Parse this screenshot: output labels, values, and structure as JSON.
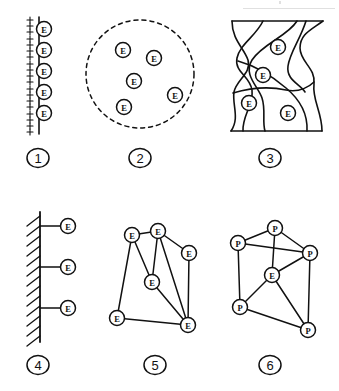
{
  "figure": {
    "width": 339,
    "height": 391,
    "background": "#ffffff",
    "ink_color": "#111111",
    "node_fill": "#ffffff"
  },
  "panels": [
    {
      "id": "panel-1",
      "number": "1",
      "kind": "charged-surface-with-electrons",
      "number_pos": {
        "x": 38,
        "y": 158
      },
      "surface": {
        "type": "vertical-line",
        "x": 39,
        "y_top": 17,
        "y_bottom": 134
      },
      "charges": {
        "symbol": "+",
        "count": 19,
        "x": 30,
        "y_start": 20,
        "y_step": 6.2
      },
      "nodes": [
        {
          "label": "E",
          "x": 44,
          "y": 29
        },
        {
          "label": "E",
          "x": 44,
          "y": 50
        },
        {
          "label": "E",
          "x": 44,
          "y": 71
        },
        {
          "label": "E",
          "x": 44,
          "y": 92
        },
        {
          "label": "E",
          "x": 44,
          "y": 113
        }
      ],
      "node_radius": 7.5
    },
    {
      "id": "panel-2",
      "number": "2",
      "kind": "dashed-boundary-with-free-electrons",
      "number_pos": {
        "x": 140,
        "y": 158
      },
      "boundary": {
        "type": "dashed-circle",
        "cx": 140,
        "cy": 74,
        "r": 54,
        "dash": "4 4"
      },
      "nodes": [
        {
          "label": "E",
          "x": 123,
          "y": 50
        },
        {
          "label": "E",
          "x": 154,
          "y": 58
        },
        {
          "label": "E",
          "x": 134,
          "y": 81
        },
        {
          "label": "E",
          "x": 175,
          "y": 95
        },
        {
          "label": "E",
          "x": 124,
          "y": 107
        }
      ],
      "node_radius": 7.5
    },
    {
      "id": "panel-3",
      "number": "3",
      "kind": "grain-cells-with-electrons",
      "number_pos": {
        "x": 270,
        "y": 158
      },
      "nodes": [
        {
          "label": "E",
          "x": 278,
          "y": 47
        },
        {
          "label": "E",
          "x": 263,
          "y": 75
        },
        {
          "label": "E",
          "x": 249,
          "y": 103
        },
        {
          "label": "E",
          "x": 288,
          "y": 113
        }
      ],
      "node_radius": 7.5
    },
    {
      "id": "panel-4",
      "number": "4",
      "kind": "hatched-wall-with-bound-electrons",
      "number_pos": {
        "x": 38,
        "y": 365
      },
      "wall": {
        "type": "hatched-vertical-line",
        "x": 40,
        "y_top": 212,
        "y_bottom": 342,
        "hatch_count": 13
      },
      "nodes": [
        {
          "label": "E",
          "x": 68,
          "y": 226
        },
        {
          "label": "E",
          "x": 68,
          "y": 267
        },
        {
          "label": "E",
          "x": 68,
          "y": 308
        }
      ],
      "node_radius": 7.5
    },
    {
      "id": "panel-5",
      "number": "5",
      "kind": "electron-network",
      "number_pos": {
        "x": 155,
        "y": 365
      },
      "nodes": [
        {
          "id": "a",
          "label": "E",
          "x": 132,
          "y": 235
        },
        {
          "id": "b",
          "label": "E",
          "x": 158,
          "y": 231
        },
        {
          "id": "c",
          "label": "E",
          "x": 189,
          "y": 253
        },
        {
          "id": "d",
          "label": "E",
          "x": 152,
          "y": 282
        },
        {
          "id": "e",
          "label": "E",
          "x": 117,
          "y": 318
        },
        {
          "id": "f",
          "label": "E",
          "x": 188,
          "y": 325
        }
      ],
      "edges": [
        [
          "a",
          "b"
        ],
        [
          "a",
          "d"
        ],
        [
          "a",
          "e"
        ],
        [
          "b",
          "c"
        ],
        [
          "b",
          "d"
        ],
        [
          "b",
          "f"
        ],
        [
          "c",
          "f"
        ],
        [
          "d",
          "f"
        ],
        [
          "e",
          "f"
        ]
      ],
      "node_radius": 7.5
    },
    {
      "id": "panel-6",
      "number": "6",
      "kind": "proton-lattice-with-electron",
      "number_pos": {
        "x": 270,
        "y": 365
      },
      "nodes": [
        {
          "id": "p1",
          "label": "P",
          "x": 275,
          "y": 228
        },
        {
          "id": "p2",
          "label": "P",
          "x": 238,
          "y": 243
        },
        {
          "id": "p3",
          "label": "P",
          "x": 310,
          "y": 253
        },
        {
          "id": "e1",
          "label": "E",
          "x": 272,
          "y": 275
        },
        {
          "id": "p4",
          "label": "P",
          "x": 240,
          "y": 307
        },
        {
          "id": "p5",
          "label": "P",
          "x": 308,
          "y": 330
        }
      ],
      "edges": [
        [
          "p1",
          "p2"
        ],
        [
          "p1",
          "p3"
        ],
        [
          "p1",
          "e1"
        ],
        [
          "p2",
          "p3"
        ],
        [
          "p2",
          "p4"
        ],
        [
          "p3",
          "e1"
        ],
        [
          "p3",
          "p5"
        ],
        [
          "e1",
          "p4"
        ],
        [
          "e1",
          "p5"
        ],
        [
          "p4",
          "p5"
        ]
      ],
      "node_radius": 7.5
    }
  ]
}
